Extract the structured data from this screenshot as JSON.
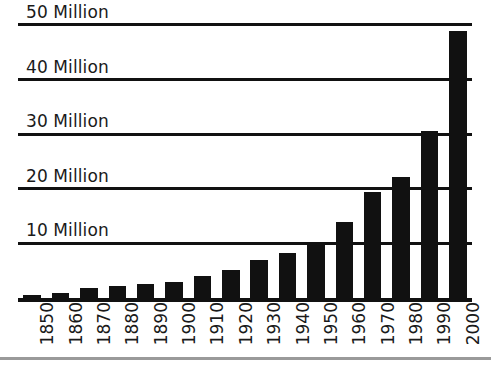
{
  "chart_data": {
    "type": "bar",
    "title": "",
    "subtitle": "",
    "xlabel": "",
    "ylabel": "",
    "categories": [
      "1850",
      "1860",
      "1870",
      "1880",
      "1890",
      "1900",
      "1910",
      "1920",
      "1930",
      "1940",
      "1950",
      "1960",
      "1970",
      "1980",
      "1990",
      "2000"
    ],
    "values": [
      0.5,
      1.0,
      1.8,
      2.2,
      2.6,
      3.0,
      4.0,
      5.2,
      7.0,
      8.2,
      10.1,
      14.0,
      19.5,
      22.2,
      30.5,
      48.8
    ],
    "ylim": [
      0,
      52
    ],
    "ytick_values": [
      10,
      20,
      30,
      40,
      50
    ],
    "ytick_labels": [
      "10 Million",
      "20 Million",
      "30 Million",
      "40 Million",
      "50 Million"
    ],
    "grid": true,
    "grid_axis": "y",
    "legend": "none",
    "bar_color": "#111111",
    "grid_color": "#111111",
    "axis_color": "#111111",
    "background_color": "#ffffff",
    "xtick_rotation": 90,
    "annotations": []
  }
}
